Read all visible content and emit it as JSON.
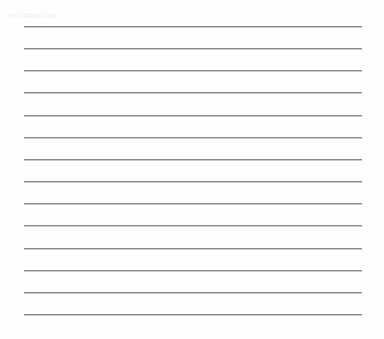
{
  "page": {
    "type": "lined-paper",
    "ghost_text": "For Official Use",
    "rule_count": 14,
    "rule_color": "#8a8a8a",
    "background_color": "#fefefe"
  }
}
